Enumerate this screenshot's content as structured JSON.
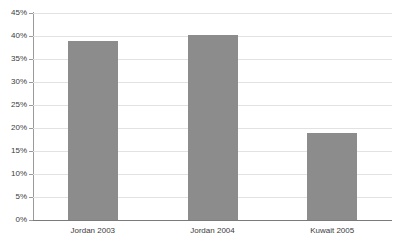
{
  "chart_data": {
    "type": "bar",
    "title": "",
    "subtitle": "",
    "xlabel": "",
    "ylabel": "",
    "categories": [
      "Jordan 2003",
      "Jordan 2004",
      "Kuwait 2005"
    ],
    "values": [
      39.0,
      40.3,
      19.0
    ],
    "value_labels": [
      "39%",
      "40%",
      "19%"
    ],
    "ylim": [
      0,
      45
    ],
    "y_ticks": [
      0,
      5,
      10,
      15,
      20,
      25,
      30,
      35,
      40,
      45
    ],
    "y_tick_labels": [
      "0%",
      "5%",
      "10%",
      "15%",
      "20%",
      "25%",
      "30%",
      "35%",
      "40%",
      "45%"
    ],
    "grid": true,
    "legend": false,
    "legend_position": "none",
    "bar_color": "#8c8c8c",
    "gridline_color": "#e2e2e2",
    "axis_color": "#9a9a9a",
    "baseline_color": "#7a7a7a",
    "text_color": "#3b3b3b",
    "background_color": "#ffffff"
  }
}
